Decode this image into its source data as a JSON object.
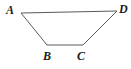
{
  "figure": {
    "name": "trapezoid-abcd",
    "width": 131,
    "height": 69,
    "background_color": "#ffffff",
    "stroke_color": "#5a5a5a",
    "stroke_width": 1,
    "vertices": [
      {
        "id": "A",
        "label": "A",
        "x": 21,
        "y": 13,
        "label_x": 6,
        "label_y": 4
      },
      {
        "id": "B",
        "label": "B",
        "x": 47,
        "y": 45,
        "label_x": 43,
        "label_y": 50
      },
      {
        "id": "C",
        "label": "C",
        "x": 83,
        "y": 45,
        "label_x": 77,
        "label_y": 50
      },
      {
        "id": "D",
        "label": "D",
        "x": 117,
        "y": 11,
        "label_x": 119,
        "label_y": 3
      }
    ],
    "edges": [
      {
        "id": "AD",
        "from": "A",
        "to": "D",
        "points": "21,13 117,11"
      },
      {
        "id": "DC",
        "from": "D",
        "to": "C",
        "points": "117,11 83,45"
      },
      {
        "id": "CB",
        "from": "C",
        "to": "B",
        "points": "83,45 47,45"
      },
      {
        "id": "BA",
        "from": "B",
        "to": "A",
        "points": "47,45 21,13"
      }
    ],
    "polygon_points": "21,13 117,11 83,45 47,45",
    "fill_color": "none"
  },
  "labels": {
    "A": "A",
    "B": "B",
    "C": "C",
    "D": "D"
  }
}
